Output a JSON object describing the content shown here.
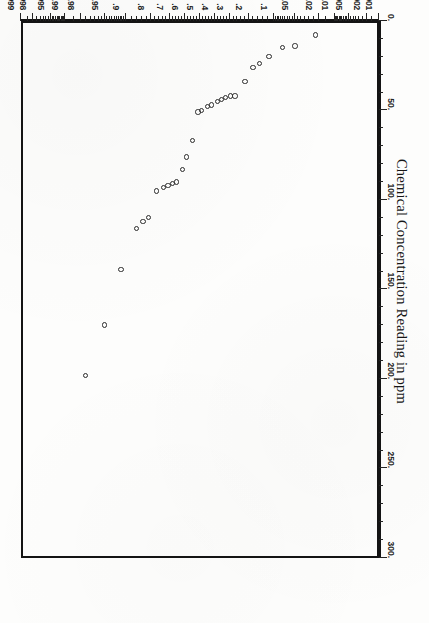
{
  "figure": {
    "orientation": "rotated-180",
    "frame_color": "#141414",
    "marker_color": "#2b2b2b",
    "background": "#ffffff"
  },
  "chart_data": {
    "type": "scatter",
    "title": "",
    "subtitle": "",
    "xlabel": "Probability",
    "ylabel": "Chemical Concentration Reading in ppm",
    "legend": [],
    "grid": false,
    "xscale": "normal-probability",
    "yscale": "linear",
    "xlim": [
      0.001,
      0.999
    ],
    "ylim": [
      0,
      300
    ],
    "xticks": [
      0.001,
      0.002,
      0.005,
      0.01,
      0.02,
      0.05,
      0.1,
      0.2,
      0.3,
      0.4,
      0.5,
      0.6,
      0.7,
      0.8,
      0.9,
      0.95,
      0.98,
      0.99,
      0.995,
      0.998,
      0.999
    ],
    "xticklabels": [
      ".001",
      ".002",
      ".005",
      ".01",
      ".02",
      ".05",
      ".1",
      ".2",
      ".3",
      ".4",
      ".5",
      ".6",
      ".7",
      ".8",
      ".9",
      ".95",
      ".98",
      ".99",
      ".995",
      ".998",
      ".999"
    ],
    "yticks": [
      0,
      50,
      100,
      150,
      200,
      250,
      300
    ],
    "yticklabels": [
      "0.",
      "50.",
      "100.",
      "150.",
      "200.",
      "250.",
      "300."
    ],
    "series": [
      {
        "name": "Chemical concentration readings",
        "marker": "open-circle",
        "points": [
          {
            "probability": 0.021,
            "concentration": 9
          },
          {
            "probability": 0.047,
            "concentration": 15
          },
          {
            "probability": 0.073,
            "concentration": 16
          },
          {
            "probability": 0.11,
            "concentration": 21
          },
          {
            "probability": 0.145,
            "concentration": 25
          },
          {
            "probability": 0.171,
            "concentration": 27
          },
          {
            "probability": 0.209,
            "concentration": 35
          },
          {
            "probability": 0.262,
            "concentration": 43
          },
          {
            "probability": 0.289,
            "concentration": 43
          },
          {
            "probability": 0.316,
            "concentration": 44
          },
          {
            "probability": 0.342,
            "concentration": 45
          },
          {
            "probability": 0.368,
            "concentration": 46
          },
          {
            "probability": 0.408,
            "concentration": 48
          },
          {
            "probability": 0.434,
            "concentration": 49
          },
          {
            "probability": 0.474,
            "concentration": 51
          },
          {
            "probability": 0.5,
            "concentration": 52
          },
          {
            "probability": 0.539,
            "concentration": 68
          },
          {
            "probability": 0.579,
            "concentration": 77
          },
          {
            "probability": 0.605,
            "concentration": 84
          },
          {
            "probability": 0.645,
            "concentration": 91
          },
          {
            "probability": 0.671,
            "concentration": 92
          },
          {
            "probability": 0.697,
            "concentration": 93
          },
          {
            "probability": 0.724,
            "concentration": 94
          },
          {
            "probability": 0.763,
            "concentration": 96
          },
          {
            "probability": 0.803,
            "concentration": 111
          },
          {
            "probability": 0.829,
            "concentration": 113
          },
          {
            "probability": 0.855,
            "concentration": 117
          },
          {
            "probability": 0.908,
            "concentration": 140
          },
          {
            "probability": 0.947,
            "concentration": 171
          },
          {
            "probability": 0.974,
            "concentration": 199
          }
        ]
      }
    ]
  }
}
